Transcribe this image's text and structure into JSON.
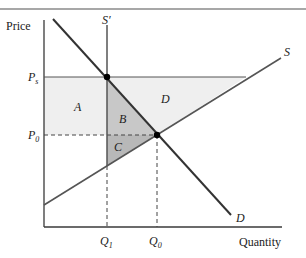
{
  "diagram": {
    "type": "supply-demand-price-support",
    "axes": {
      "y_label": "Price",
      "x_label": "Quantity"
    },
    "curves": {
      "supply": "S",
      "supply_restricted": "S′",
      "demand": "D"
    },
    "price_labels": {
      "support": "P",
      "support_sub": "s",
      "equilibrium": "P",
      "equilibrium_sub": "0"
    },
    "quantity_labels": {
      "restricted": "Q",
      "restricted_sub": "1",
      "equilibrium": "Q",
      "equilibrium_sub": "0"
    },
    "areas": {
      "a": "A",
      "b": "B",
      "c": "C",
      "d": "D"
    },
    "colors": {
      "light_fill": "#efefef",
      "dark_fill": "#c4c4c4",
      "line": "#3a3a3a",
      "rule": "#7a7a7a"
    }
  }
}
